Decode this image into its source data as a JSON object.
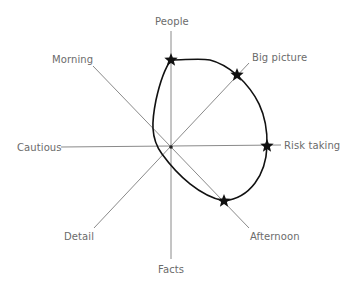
{
  "diagram": {
    "title": "",
    "axes": [
      {
        "id": "people",
        "label": "People"
      },
      {
        "id": "big_picture",
        "label": "Big picture"
      },
      {
        "id": "risk_taking",
        "label": "Risk taking"
      },
      {
        "id": "afternoon",
        "label": "Afternoon"
      },
      {
        "id": "facts",
        "label": "Facts"
      },
      {
        "id": "detail",
        "label": "Detail"
      },
      {
        "id": "cautious",
        "label": "Cautious"
      },
      {
        "id": "morning",
        "label": "Morning"
      }
    ],
    "markers": [
      {
        "axis": "People",
        "shape": "star"
      },
      {
        "axis": "Big picture",
        "shape": "star"
      },
      {
        "axis": "Risk taking",
        "shape": "star"
      },
      {
        "axis": "Afternoon",
        "shape": "star"
      }
    ],
    "colors": {
      "axis_line": "#8a8a8a",
      "profile_curve": "#111111",
      "label_text": "#6b6b6b",
      "background": "#ffffff"
    }
  }
}
